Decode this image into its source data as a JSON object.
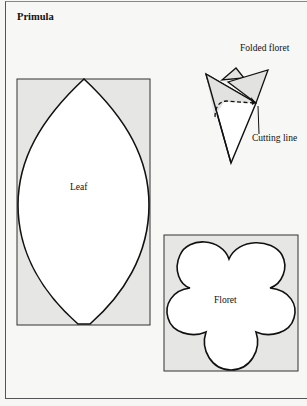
{
  "title": "Primula",
  "labels": {
    "folded_floret": "Folded floret",
    "cutting_line": "Cutting line",
    "leaf": "Leaf",
    "floret": "Floret"
  },
  "colors": {
    "background": "#f7f7f5",
    "template_fill": "#e6e6e4",
    "shape_fill": "#ffffff",
    "outline": "#111111"
  }
}
